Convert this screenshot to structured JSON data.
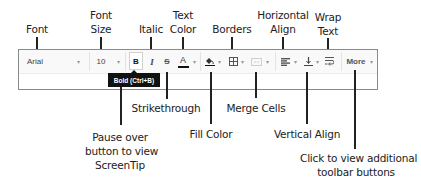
{
  "toolbar": {
    "font": {
      "value": "Arial",
      "icon": "chevron-down-icon"
    },
    "font_size": {
      "value": "10",
      "icon": "chevron-down-icon"
    },
    "bold": {
      "glyph": "B"
    },
    "italic": {
      "glyph": "I"
    },
    "strikethrough": {
      "glyph": "S"
    },
    "text_color": {
      "glyph": "A",
      "bar_color": "#111111"
    },
    "fill_color": {
      "icon": "paint-bucket-icon"
    },
    "borders": {
      "icon": "borders-grid-icon"
    },
    "merge_cells": {
      "icon": "merge-cells-icon"
    },
    "horizontal_align": {
      "icon": "align-left-icon"
    },
    "vertical_align": {
      "icon": "align-bottom-icon"
    },
    "wrap_text": {
      "icon": "wrap-text-icon"
    },
    "more": {
      "label": "More"
    },
    "dropdown_glyph": "▾"
  },
  "tooltip": {
    "text": "Bold (Ctrl+B)"
  },
  "callouts": {
    "font": "Font",
    "font_size_1": "Font",
    "font_size_2": "Size",
    "italic": "Italic",
    "text_color_1": "Text",
    "text_color_2": "Color",
    "borders": "Borders",
    "horizontal_align_1": "Horizontal",
    "horizontal_align_2": "Align",
    "wrap_text_1": "Wrap",
    "wrap_text_2": "Text",
    "strikethrough": "Strikethrough",
    "screentip_1": "Pause over",
    "screentip_2": "button to view",
    "screentip_3": "ScreenTip",
    "fill_color": "Fill Color",
    "merge_cells": "Merge Cells",
    "vertical_align": "Vertical Align",
    "more_1": "Click to view additional",
    "more_2": "toolbar buttons"
  }
}
